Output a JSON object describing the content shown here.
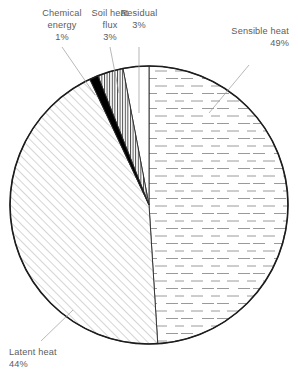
{
  "chart_data": {
    "type": "pie",
    "title": "",
    "subtitle": "",
    "xlabel": "",
    "ylabel": "",
    "legend_position": "callout-labels",
    "grid": false,
    "units": "percent",
    "total": 100,
    "start_angle_deg": 0,
    "direction": "clockwise",
    "categories": [
      "Sensible heat",
      "Latent heat",
      "Chemical energy",
      "Soil heat flux",
      "Residual"
    ],
    "values": [
      49,
      44,
      1,
      3,
      3
    ],
    "slices": [
      {
        "id": "sensible-heat",
        "label": "Sensible heat",
        "value": 49,
        "value_text": "49%",
        "fill_pattern": "horizontal-dashes",
        "fill_color": "#ffffff",
        "pattern_color": "#8e8e8e",
        "start_deg": 0,
        "end_deg": 176.4,
        "label_anchor": "end",
        "label_x": 288,
        "label_y": 47,
        "label_line2_y": 58
      },
      {
        "id": "latent-heat",
        "label": "Latent heat",
        "value": 44,
        "value_text": "44%",
        "fill_pattern": "diagonal-hatch",
        "fill_color": "#ffffff",
        "pattern_color": "#9b9b9b",
        "start_deg": 176.4,
        "end_deg": 334.8,
        "label_anchor": "start",
        "label_x": 10,
        "label_y": 355,
        "label_line2_y": 366
      },
      {
        "id": "chemical-energy",
        "label": "Chemical energy",
        "label_line1": "Chemical",
        "label_line2": "energy",
        "value": 1,
        "value_text": "1%",
        "fill_pattern": "solid",
        "fill_color": "#000000",
        "pattern_color": "#000000",
        "start_deg": 334.8,
        "end_deg": 338.4,
        "label_anchor": "middle",
        "label_x": 58,
        "label_y": 18,
        "label_line2_y": 29,
        "label_line3_y": 40
      },
      {
        "id": "soil-heat-flux",
        "label": "Soil heat flux",
        "label_line1": "Soil heat",
        "label_line2": "flux",
        "value": 3,
        "value_text": "3%",
        "fill_pattern": "vertical-lines",
        "fill_color": "#ffffff",
        "pattern_color": "#3a3a3a",
        "start_deg": 338.4,
        "end_deg": 349.2,
        "label_anchor": "middle",
        "label_x": 109,
        "label_y": 18,
        "label_line2_y": 29,
        "label_line3_y": 40
      },
      {
        "id": "residual",
        "label": "Residual",
        "value": 3,
        "value_text": "3%",
        "fill_pattern": "none",
        "fill_color": "#ffffff",
        "pattern_color": "#ffffff",
        "start_deg": 349.2,
        "end_deg": 360,
        "label_anchor": "middle",
        "label_x": 156,
        "label_y": 18,
        "label_line2_y": 29
      }
    ],
    "geometry": {
      "center_x": 149,
      "center_y": 205,
      "radius": 139
    }
  },
  "labels": {
    "chemical_energy": {
      "line1": "Chemical",
      "line2": "energy",
      "line3": "1%"
    },
    "soil_heat_flux": {
      "line1": "Soil heat",
      "line2": "flux",
      "line3": "3%"
    },
    "residual": {
      "line1": "Residual",
      "line2": "3%"
    },
    "sensible_heat": {
      "line1": "Sensible heat",
      "line2": "49%"
    },
    "latent_heat": {
      "line1": "Latent heat",
      "line2": "44%"
    }
  }
}
